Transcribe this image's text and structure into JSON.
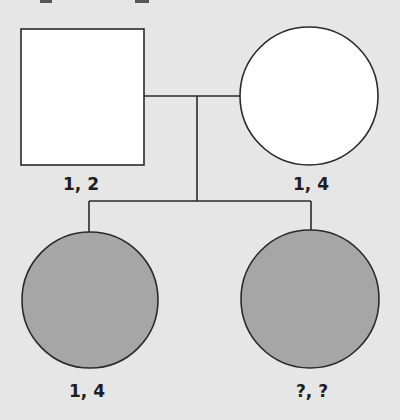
{
  "diagram": {
    "type": "pedigree",
    "colors": {
      "background": "#e6e6e6",
      "line": "#2a2a2a",
      "unaffected_fill": "#ffffff",
      "affected_fill": "#a6a6a6"
    },
    "parents": {
      "father": {
        "shape": "square",
        "affected": false,
        "label": "1, 2"
      },
      "mother": {
        "shape": "circle",
        "affected": false,
        "label": "1, 4"
      }
    },
    "children": [
      {
        "shape": "circle",
        "affected": true,
        "label": "1, 4"
      },
      {
        "shape": "circle",
        "affected": true,
        "label": "?, ?"
      }
    ]
  }
}
